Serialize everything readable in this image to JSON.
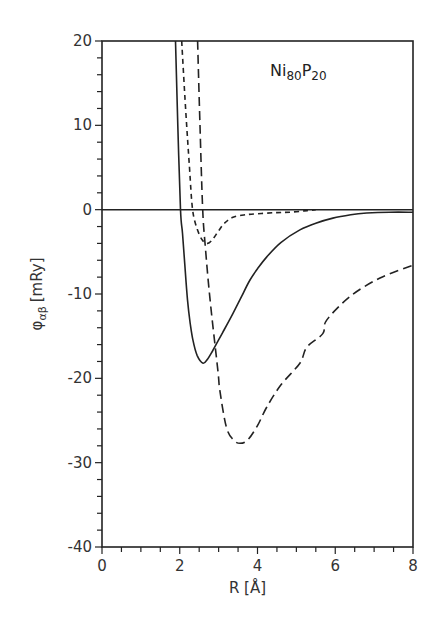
{
  "chart_data": {
    "type": "line",
    "title": "",
    "annotation": {
      "base1": "Ni",
      "sub1": "80",
      "base2": "P",
      "sub2": "20",
      "position": "top-right"
    },
    "xlabel": "R [Å]",
    "ylabel": {
      "symbol": "φ",
      "subscript": "αβ",
      "unit": "[mRy]"
    },
    "xlim": [
      0,
      8
    ],
    "ylim": [
      -40,
      20
    ],
    "xticks": [
      0,
      2,
      4,
      6,
      8
    ],
    "xtick_labels": [
      "0",
      "2",
      "4",
      "6",
      "8"
    ],
    "yticks": [
      20,
      10,
      0,
      -10,
      -20,
      -30,
      -40
    ],
    "ytick_labels": [
      "20",
      "10",
      "0",
      "-10",
      "-20",
      "-30",
      "-40"
    ],
    "x_minor_step": 0.5,
    "y_minor_step": 2,
    "grid": false,
    "zero_line": true,
    "legend": "none",
    "series": [
      {
        "name": "solid",
        "style": "solid",
        "x": [
          1.89,
          1.95,
          2.02,
          2.07,
          2.13,
          2.2,
          2.27,
          2.34,
          2.45,
          2.6,
          2.72,
          2.85,
          3.1,
          3.37,
          3.6,
          3.8,
          4.0,
          4.24,
          4.6,
          5.09,
          5.5,
          5.94,
          6.4,
          6.81,
          7.4,
          8.0
        ],
        "y": [
          20,
          10,
          0,
          -2.8,
          -6.5,
          -10.7,
          -13.5,
          -15.5,
          -17.3,
          -18.2,
          -17.7,
          -16.7,
          -14.6,
          -12.3,
          -10.2,
          -8.4,
          -7.0,
          -5.6,
          -3.9,
          -2.4,
          -1.6,
          -1.0,
          -0.6,
          -0.4,
          -0.3,
          -0.3
        ]
      },
      {
        "name": "short-dash",
        "style": "dashed-short",
        "x": [
          2.05,
          2.15,
          2.25,
          2.33,
          2.45,
          2.58,
          2.72,
          2.85,
          3.0,
          3.15,
          3.37,
          3.7,
          4.1,
          4.5,
          4.83,
          5.2,
          5.5
        ],
        "y": [
          20,
          12,
          5,
          0,
          -2.3,
          -3.6,
          -4.0,
          -3.5,
          -2.5,
          -1.6,
          -0.9,
          -0.6,
          -0.45,
          -0.35,
          -0.3,
          -0.15,
          0
        ]
      },
      {
        "name": "long-dash",
        "style": "dashed-long",
        "x": [
          2.46,
          2.52,
          2.59,
          2.66,
          2.78,
          2.98,
          3.03,
          3.2,
          3.38,
          3.55,
          3.75,
          4.0,
          4.24,
          4.6,
          5.09,
          5.27,
          5.68,
          5.78,
          6.38,
          7.15,
          8.0
        ],
        "y": [
          20,
          10,
          0,
          -4.5,
          -10.7,
          -19.0,
          -21.4,
          -25.8,
          -27.3,
          -27.7,
          -27.3,
          -25.6,
          -23.4,
          -20.8,
          -18.2,
          -16.3,
          -14.7,
          -13.1,
          -10.3,
          -8.1,
          -6.6
        ]
      }
    ]
  }
}
